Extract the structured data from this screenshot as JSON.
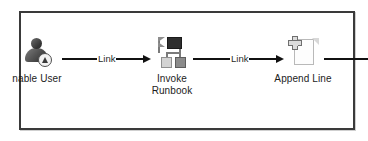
{
  "diagram": {
    "type": "workflow-flowchart",
    "frame": {
      "border_color": "#3a3a3a",
      "background": "#ffffff"
    },
    "nodes": [
      {
        "id": "enable-user",
        "label": "nable User",
        "full_label": "Enable User",
        "icon": "user-enable-icon",
        "clipped_at_left_border": true
      },
      {
        "id": "invoke-runbook",
        "label": "Invoke\nRunbook",
        "full_label": "Invoke Runbook",
        "icon": "runbook-network-icon",
        "clipped_at_left_border": false
      },
      {
        "id": "append-line",
        "label": "Append Line",
        "full_label": "Append Line",
        "icon": "document-add-icon",
        "clipped_at_left_border": false
      }
    ],
    "connectors": [
      {
        "id": "link-1",
        "label": "Link",
        "from": "enable-user",
        "to": "invoke-runbook",
        "style": "thick-arrow",
        "color": "#111111"
      },
      {
        "id": "link-2",
        "label": "Link",
        "from": "invoke-runbook",
        "to": "append-line",
        "style": "thin-arrow",
        "color": "#111111"
      },
      {
        "id": "link-3",
        "label": "",
        "from": "append-line",
        "to": "",
        "style": "line-stub-crossing-border",
        "color": "#111111"
      }
    ]
  }
}
